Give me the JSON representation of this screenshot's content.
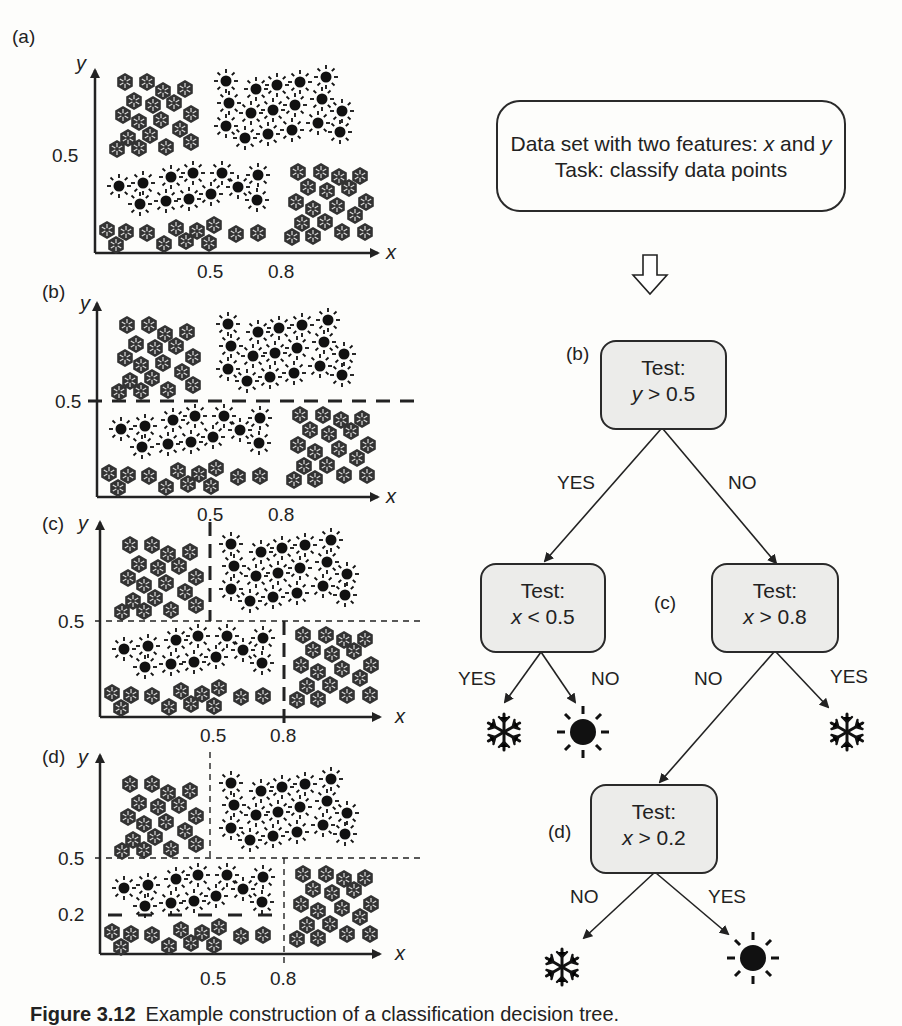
{
  "panels": [
    {
      "id": "a",
      "label": "(a)",
      "y_axis": "y",
      "x_axis": "x",
      "y_ticks": [
        "0.5"
      ],
      "x_ticks": [
        "0.5",
        "0.8"
      ],
      "splits": []
    },
    {
      "id": "b",
      "label": "(b)",
      "y_axis": "y",
      "x_axis": "x",
      "y_ticks": [
        "0.5"
      ],
      "x_ticks": [
        "0.5",
        "0.8"
      ],
      "splits": [
        "y = 0.5 (bold dashed)"
      ]
    },
    {
      "id": "c",
      "label": "(c)",
      "y_axis": "y",
      "x_axis": "x",
      "y_ticks": [
        "0.5"
      ],
      "x_ticks": [
        "0.5",
        "0.8"
      ],
      "splits": [
        "y = 0.5",
        "x = 0.5 (upper, bold)",
        "x = 0.8 (lower, bold)"
      ]
    },
    {
      "id": "d",
      "label": "(d)",
      "y_axis": "y",
      "x_axis": "x",
      "y_ticks": [
        "0.5",
        "0.2"
      ],
      "x_ticks": [
        "0.5",
        "0.8"
      ],
      "splits": [
        "y = 0.5",
        "x = 0.5",
        "x = 0.8",
        "y = 0.2 (bold, x<0.8)"
      ]
    }
  ],
  "legend": {
    "class_a": "snowflake",
    "class_b": "sun"
  },
  "top_box": {
    "line1_prefix": "Data set with two features: ",
    "line1_x": "x",
    "line1_mid": " and ",
    "line1_y": "y",
    "line2": "Task: classify data points"
  },
  "tree": {
    "root": {
      "tag": "(b)",
      "title": "Test:",
      "var": "y",
      "cond": " > 0.5"
    },
    "left": {
      "title": "Test:",
      "var": "x",
      "cond": " < 0.5"
    },
    "right": {
      "tag": "(c)",
      "title": "Test:",
      "var": "x",
      "cond": " > 0.8"
    },
    "bottom": {
      "tag": "(d)",
      "title": "Test:",
      "var": "x",
      "cond": " > 0.2"
    },
    "edges": {
      "root_yes": "YES",
      "root_no": "NO",
      "left_yes": "YES",
      "left_no": "NO",
      "right_no": "NO",
      "right_yes": "YES",
      "bottom_no": "NO",
      "bottom_yes": "YES"
    },
    "leaves": {
      "left_yes": "snowflake",
      "left_no": "sun",
      "right_yes": "snowflake",
      "bottom_no": "snowflake",
      "bottom_yes": "sun"
    }
  },
  "caption": {
    "number": "Figure 3.12",
    "text": "Example construction of a classification decision tree."
  }
}
